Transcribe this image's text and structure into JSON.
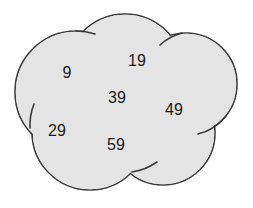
{
  "diagram": {
    "type": "cloud-of-overlapping-circles",
    "colors": {
      "fill": "#e4e4e4",
      "stroke": "#3a3a3a",
      "text": "#1a1a1a",
      "background": "#ffffff"
    },
    "numbers": [
      {
        "id": "n9",
        "label": "9",
        "x": 67,
        "y": 73
      },
      {
        "id": "n19",
        "label": "19",
        "x": 137,
        "y": 61
      },
      {
        "id": "n39",
        "label": "39",
        "x": 117,
        "y": 98
      },
      {
        "id": "n49",
        "label": "49",
        "x": 174,
        "y": 110
      },
      {
        "id": "n29",
        "label": "29",
        "x": 57,
        "y": 131
      },
      {
        "id": "n59",
        "label": "59",
        "x": 116,
        "y": 145
      }
    ]
  }
}
